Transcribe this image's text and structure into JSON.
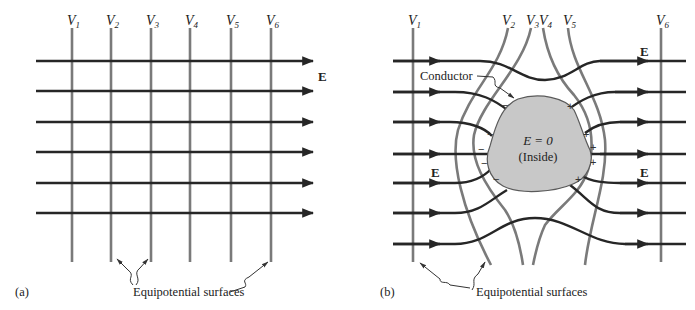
{
  "figure": {
    "panel_a": {
      "label": "(a)",
      "potential_labels": [
        {
          "sym": "V",
          "sub": "1"
        },
        {
          "sym": "V",
          "sub": "2"
        },
        {
          "sym": "V",
          "sub": "3"
        },
        {
          "sym": "V",
          "sub": "4"
        },
        {
          "sym": "V",
          "sub": "5"
        },
        {
          "sym": "V",
          "sub": "6"
        }
      ],
      "field_label": "E",
      "equipotential_caption": "Equipotential surfaces",
      "field_line_count": 6,
      "equipotential_count": 6
    },
    "panel_b": {
      "label": "(b)",
      "potential_labels": [
        {
          "sym": "V",
          "sub": "1"
        },
        {
          "sym": "V",
          "sub": "2"
        },
        {
          "sym": "V",
          "sub": "3"
        },
        {
          "sym": "V",
          "sub": "4"
        },
        {
          "sym": "V",
          "sub": "5"
        },
        {
          "sym": "V",
          "sub": "6"
        }
      ],
      "field_label_top_right": "E",
      "field_label_left": "E",
      "field_label_right": "E",
      "conductor_label": "Conductor",
      "inside_field": "E = 0",
      "inside_note": "(Inside)",
      "negative_charge": "−",
      "positive_charge": "+",
      "equipotential_caption": "Equipotential surfaces"
    },
    "colors": {
      "field_line": "#262626",
      "equipotential": "#7a7a7a",
      "conductor_fill": "#c8c8c8",
      "conductor_stroke": "#5a5a5a"
    }
  }
}
